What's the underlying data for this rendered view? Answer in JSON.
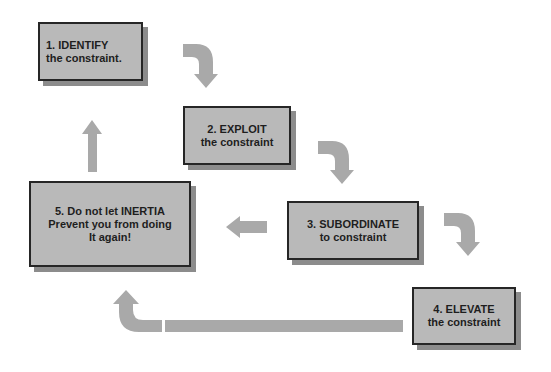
{
  "diagram": {
    "colors": {
      "background": "#ffffff",
      "box_fill": "#b9b9b9",
      "box_border": "#262626",
      "box_shadow": "#8c8c8c",
      "arrow": "#a9a9a9",
      "text": "#1e1e1e"
    },
    "steps": [
      {
        "id": "step1",
        "line1": "1. IDENTIFY",
        "line2": "the constraint.",
        "line3": ""
      },
      {
        "id": "step2",
        "line1": "2. EXPLOIT",
        "line2": "the constraint",
        "line3": ""
      },
      {
        "id": "step3",
        "line1": "3. SUBORDINATE",
        "line2": "to constraint",
        "line3": ""
      },
      {
        "id": "step4",
        "line1": "4. ELEVATE",
        "line2": "the constraint",
        "line3": ""
      },
      {
        "id": "step5",
        "line1": "5. Do not let INERTIA",
        "line2": "Prevent you from doing",
        "line3": "It again!"
      }
    ],
    "arrows": [
      {
        "from": "step1",
        "to": "step2",
        "shape": "curved-right-down"
      },
      {
        "from": "step2",
        "to": "step3",
        "shape": "curved-right-down"
      },
      {
        "from": "step3",
        "to": "step4",
        "shape": "curved-right-down"
      },
      {
        "from": "step3",
        "to": "step5",
        "shape": "left"
      },
      {
        "from": "step4",
        "to": "step5",
        "shape": "long-left-curved-up"
      },
      {
        "from": "step5",
        "to": "step1",
        "shape": "up"
      }
    ]
  }
}
